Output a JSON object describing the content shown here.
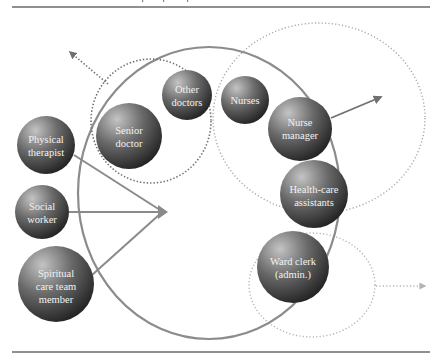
{
  "diagram": {
    "colors": {
      "rule": "#6a6a6a",
      "main_circle": "#8c8c8c",
      "dotted_doctors": "#6f6f6f",
      "dotted_nurses": "#a8a8a8",
      "dotted_clerk": "#b4b4b4",
      "arrow": "#8a8a8a",
      "sphere_light": "#bdbdbd",
      "sphere_dark": "#1e1e1e",
      "label": "#f2f2f2"
    },
    "nodes": [
      {
        "id": "physical-therapist",
        "lines": [
          "Physical",
          "therapist"
        ]
      },
      {
        "id": "senior-doctor",
        "lines": [
          "Senior",
          "doctor"
        ]
      },
      {
        "id": "other-doctors",
        "lines": [
          "Other",
          "doctors"
        ]
      },
      {
        "id": "nurses",
        "lines": [
          "Nurses"
        ]
      },
      {
        "id": "nurse-manager",
        "lines": [
          "Nurse",
          "manager"
        ]
      },
      {
        "id": "health-care-assistants",
        "lines": [
          "Health-care",
          "assistants"
        ]
      },
      {
        "id": "social-worker",
        "lines": [
          "Social",
          "worker"
        ]
      },
      {
        "id": "spiritual-care-team-member",
        "lines": [
          "Spiritual",
          "care team",
          "member"
        ]
      },
      {
        "id": "ward-clerk",
        "lines": [
          "Ward clerk",
          "(admin.)"
        ]
      }
    ],
    "groups": [
      {
        "id": "core-team",
        "style": "solid"
      },
      {
        "id": "doctors-group",
        "style": "dotted"
      },
      {
        "id": "nursing-group",
        "style": "dotted"
      },
      {
        "id": "admin-group",
        "style": "dotted"
      }
    ]
  }
}
